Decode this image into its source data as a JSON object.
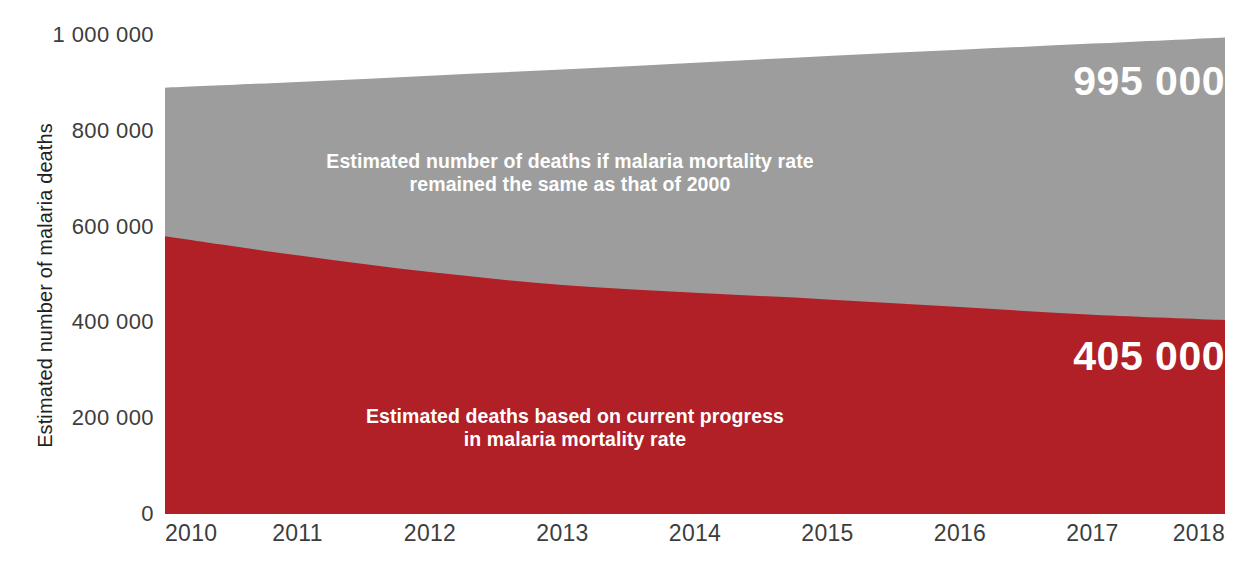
{
  "chart_data": {
    "type": "area",
    "title": "",
    "subtitle": "",
    "xlabel": "",
    "ylabel": "Estimated number of malaria deaths",
    "x": [
      2010,
      2011,
      2012,
      2013,
      2014,
      2015,
      2016,
      2017,
      2018
    ],
    "categories": [
      "2010",
      "2011",
      "2012",
      "2013",
      "2014",
      "2015",
      "2016",
      "2017",
      "2018"
    ],
    "xlim": [
      2010,
      2018
    ],
    "ylim": [
      0,
      1000000
    ],
    "yticks": [
      0,
      200000,
      400000,
      600000,
      800000,
      1000000
    ],
    "ytick_labels": [
      "0",
      "200 000",
      "400 000",
      "600 000",
      "800 000",
      "1 000 000"
    ],
    "grid": false,
    "legend_position": "inside-areas",
    "stacked": false,
    "series": [
      {
        "name": "Estimated number of deaths if malaria mortality rate remained the same as that of 2000",
        "color": "#9d9d9d",
        "values": [
          890000,
          902000,
          915000,
          928000,
          942000,
          956000,
          969000,
          982000,
          995000
        ]
      },
      {
        "name": "Estimated deaths based on current progress in malaria mortality rate",
        "color": "#b02026",
        "values": [
          580000,
          540000,
          505000,
          478000,
          462000,
          448000,
          432000,
          416000,
          405000
        ]
      }
    ],
    "annotations": [
      {
        "id": "gray-area-label",
        "text": "Estimated number of deaths if malaria mortality rate\nremained the same as that of 2000",
        "color": "#ffffff"
      },
      {
        "id": "red-area-label",
        "text": "Estimated deaths based on current progress\nin malaria mortality rate",
        "color": "#ffffff"
      },
      {
        "id": "gray-end-value",
        "text": "995 000",
        "color": "#ffffff"
      },
      {
        "id": "red-end-value",
        "text": "405 000",
        "color": "#ffffff"
      }
    ],
    "colors": {
      "gray_area": "#9d9d9d",
      "red_area": "#b02026",
      "axis_text": "#3d3d3d",
      "axis_title": "#231f20",
      "background": "#ffffff",
      "annotation_text": "#ffffff"
    }
  },
  "axes": {
    "y_title": "Estimated number of malaria deaths",
    "y_ticks": [
      {
        "label": "1 000 000",
        "value": 1000000
      },
      {
        "label": "800 000",
        "value": 800000
      },
      {
        "label": "600 000",
        "value": 600000
      },
      {
        "label": "400 000",
        "value": 400000
      },
      {
        "label": "200 000",
        "value": 200000
      },
      {
        "label": "0",
        "value": 0
      }
    ],
    "x_ticks": [
      {
        "label": "2010",
        "value": 2010
      },
      {
        "label": "2011",
        "value": 2011
      },
      {
        "label": "2012",
        "value": 2012
      },
      {
        "label": "2013",
        "value": 2013
      },
      {
        "label": "2014",
        "value": 2014
      },
      {
        "label": "2015",
        "value": 2015
      },
      {
        "label": "2016",
        "value": 2016
      },
      {
        "label": "2017",
        "value": 2017
      },
      {
        "label": "2018",
        "value": 2018
      }
    ]
  },
  "labels": {
    "gray_area_line1": "Estimated number of deaths if malaria mortality rate",
    "gray_area_line2": "remained the same as that of 2000",
    "red_area_line1": "Estimated deaths based on current progress",
    "red_area_line2": "in malaria mortality rate",
    "gray_end_value": "995 000",
    "red_end_value": "405 000"
  }
}
